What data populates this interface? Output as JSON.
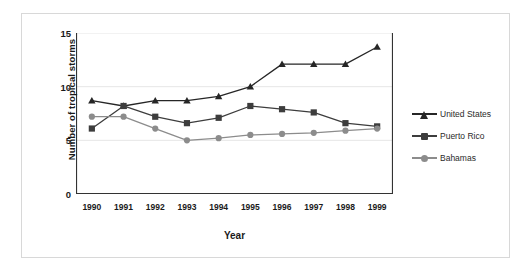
{
  "chart_data": {
    "type": "line",
    "title": "",
    "xlabel": "Year",
    "ylabel": "Number of tropical storms",
    "categories": [
      "1990",
      "1991",
      "1992",
      "1993",
      "1994",
      "1995",
      "1996",
      "1997",
      "1998",
      "1999"
    ],
    "x": [
      1990,
      1991,
      1992,
      1993,
      1994,
      1995,
      1996,
      1997,
      1998,
      1999
    ],
    "ylim": [
      0,
      15
    ],
    "yticks": [
      0,
      5,
      10,
      15
    ],
    "ytick_labels": [
      "0",
      "5",
      "10",
      "15"
    ],
    "grid": true,
    "legend_position": "right",
    "series": [
      {
        "name": "United States",
        "marker": "triangle",
        "color": "#262626",
        "values": [
          8.7,
          8.2,
          8.7,
          8.7,
          9.1,
          10.0,
          12.1,
          12.1,
          12.1,
          13.7
        ]
      },
      {
        "name": "Puerto Rico",
        "marker": "square",
        "color": "#3d3d3d",
        "values": [
          6.1,
          8.2,
          7.2,
          6.6,
          7.1,
          8.2,
          7.9,
          7.6,
          6.6,
          6.3
        ]
      },
      {
        "name": "Bahamas",
        "marker": "circle",
        "color": "#8c8c8c",
        "values": [
          7.2,
          7.2,
          6.1,
          5.0,
          5.2,
          5.5,
          5.6,
          5.7,
          5.9,
          6.1
        ]
      }
    ]
  },
  "colors": {
    "axis": "#333333",
    "grid": "#e6e6e6",
    "frame": "#d8d8d8",
    "text": "#1a1a1a",
    "background": "#ffffff"
  }
}
